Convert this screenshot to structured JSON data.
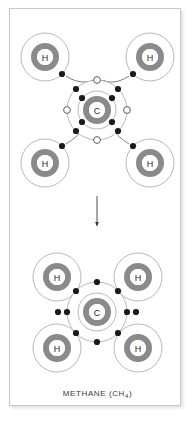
{
  "figure": {
    "caption_main": "METHANE (CH",
    "caption_sub": "4",
    "caption_close": ")",
    "caption_full": "METHANE (CH4)",
    "background_color": "#ffffff",
    "frame_border_color": "#c9c9c9",
    "nucleus_ring_color": "#8a8a8a",
    "shell_line_color": "#9a9a9a",
    "electron_color": "#1a1a1a",
    "hollow_electron_fill": "#ffffff",
    "arrow_color": "#6e6e6e",
    "label_color": "#2b2b2b"
  },
  "stages": [
    {
      "name": "before-bonding",
      "description": "Separate carbon and four hydrogen atoms with electrons transferring into carbon outer shell vacancies",
      "carbon": {
        "label": "C",
        "center": [
          97,
          110
        ],
        "nucleus_radius": 11,
        "inner_shell_radius": 19,
        "outer_shell_radius": 30,
        "outer_electrons": 4,
        "vacancies": 4
      },
      "hydrogens": [
        {
          "label": "H",
          "center": [
            45,
            57
          ],
          "position": "top-left",
          "shell_radius": 24,
          "nucleus_radius": 11,
          "electron_angle_deg": 45
        },
        {
          "label": "H",
          "center": [
            150,
            57
          ],
          "position": "top-right",
          "shell_radius": 24,
          "nucleus_radius": 11,
          "electron_angle_deg": 135
        },
        {
          "label": "H",
          "center": [
            45,
            163
          ],
          "position": "bottom-left",
          "shell_radius": 24,
          "nucleus_radius": 11,
          "electron_angle_deg": -45
        },
        {
          "label": "H",
          "center": [
            150,
            163
          ],
          "position": "bottom-right",
          "shell_radius": 24,
          "nucleus_radius": 11,
          "electron_angle_deg": -135
        }
      ]
    },
    {
      "name": "after-bonding",
      "description": "Methane molecule with four shared electron pairs completing the carbon octet",
      "carbon": {
        "label": "C",
        "center": [
          97,
          312
        ],
        "nucleus_radius": 11,
        "inner_shell_radius": 19,
        "outer_shell_radius": 30,
        "outer_electrons": 8,
        "shared_pairs": 4
      },
      "hydrogens": [
        {
          "label": "H",
          "center": [
            57,
            277
          ],
          "position": "top-left",
          "shell_radius": 24,
          "nucleus_radius": 11
        },
        {
          "label": "H",
          "center": [
            138,
            277
          ],
          "position": "top-right",
          "shell_radius": 24,
          "nucleus_radius": 11
        },
        {
          "label": "H",
          "center": [
            57,
            348
          ],
          "position": "bottom-left",
          "shell_radius": 24,
          "nucleus_radius": 11
        },
        {
          "label": "H",
          "center": [
            138,
            348
          ],
          "position": "bottom-right",
          "shell_radius": 24,
          "nucleus_radius": 11
        }
      ]
    }
  ],
  "transition_arrow": {
    "name": "downward-transition-arrow",
    "from": [
      97,
      196
    ],
    "to": [
      97,
      228
    ],
    "direction": "down"
  }
}
